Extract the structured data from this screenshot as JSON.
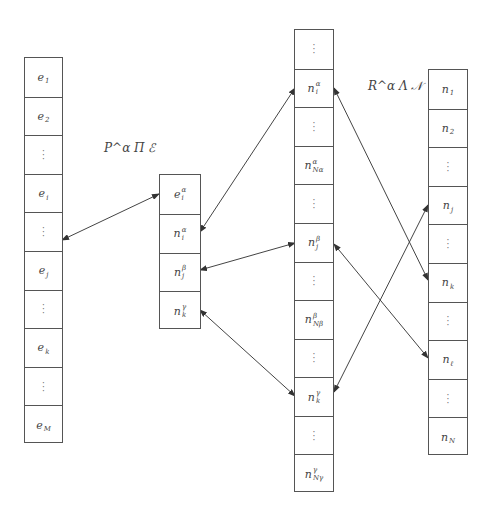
{
  "labels": {
    "left_relation": "P^α Π ℰ",
    "right_relation": "R^α Λ 𝒩"
  },
  "columns": {
    "E": {
      "cells": [
        {
          "base": "e",
          "sub": "1",
          "sup": ""
        },
        {
          "base": "e",
          "sub": "2",
          "sup": ""
        },
        {
          "dots": true
        },
        {
          "base": "e",
          "sub": "i",
          "sup": ""
        },
        {
          "dots": true
        },
        {
          "base": "e",
          "sub": "j",
          "sup": ""
        },
        {
          "dots": true
        },
        {
          "base": "e",
          "sub": "k",
          "sup": ""
        },
        {
          "dots": true
        },
        {
          "base": "e",
          "sub": "M",
          "sup": ""
        }
      ]
    },
    "P": {
      "cells": [
        {
          "base": "e",
          "sub": "i",
          "sup": "α"
        },
        {
          "base": "n",
          "sub": "i",
          "sup": "α"
        },
        {
          "base": "n",
          "sub": "j",
          "sup": "β"
        },
        {
          "base": "n",
          "sub": "k",
          "sup": "γ"
        }
      ]
    },
    "R": {
      "cells": [
        {
          "dots": true
        },
        {
          "base": "n",
          "sub": "i",
          "sup": "α"
        },
        {
          "dots": true
        },
        {
          "base": "n",
          "sub": "N_α",
          "sup": "α"
        },
        {
          "dots": true
        },
        {
          "base": "n",
          "sub": "j",
          "sup": "β"
        },
        {
          "dots": true
        },
        {
          "base": "n",
          "sub": "N_β",
          "sup": "β"
        },
        {
          "dots": true
        },
        {
          "base": "n",
          "sub": "k",
          "sup": "γ"
        },
        {
          "dots": true
        },
        {
          "base": "n",
          "sub": "N_γ",
          "sup": "γ"
        }
      ]
    },
    "N": {
      "cells": [
        {
          "base": "n",
          "sub": "1",
          "sup": ""
        },
        {
          "base": "n",
          "sub": "2",
          "sup": ""
        },
        {
          "dots": true
        },
        {
          "base": "n",
          "sub": "j",
          "sup": ""
        },
        {
          "dots": true
        },
        {
          "base": "n",
          "sub": "k",
          "sup": ""
        },
        {
          "dots": true
        },
        {
          "base": "n",
          "sub": "ℓ",
          "sup": ""
        },
        {
          "dots": true
        },
        {
          "base": "n",
          "sub": "N",
          "sup": ""
        }
      ]
    }
  },
  "arrows": [
    {
      "from": "E.e_j",
      "to": "P.e_i^α",
      "x1": 62,
      "y1": 240,
      "x2": 159,
      "y2": 194
    },
    {
      "from": "P.n_i^α",
      "to": "R.n_i^α",
      "x1": 200,
      "y1": 232,
      "x2": 295,
      "y2": 88
    },
    {
      "from": "P.n_j^β",
      "to": "R.n_j^β",
      "x1": 200,
      "y1": 270,
      "x2": 295,
      "y2": 243
    },
    {
      "from": "P.n_k^γ",
      "to": "R.n_k^γ",
      "x1": 200,
      "y1": 310,
      "x2": 295,
      "y2": 396
    },
    {
      "from": "R.n_i^α",
      "to": "N.n_k",
      "x1": 334,
      "y1": 88,
      "x2": 428,
      "y2": 280
    },
    {
      "from": "R.n_j^β",
      "to": "N.n_ℓ",
      "x1": 334,
      "y1": 244,
      "x2": 428,
      "y2": 358
    },
    {
      "from": "R.n_k^γ",
      "to": "N.n_j",
      "x1": 334,
      "y1": 392,
      "x2": 428,
      "y2": 205
    }
  ]
}
